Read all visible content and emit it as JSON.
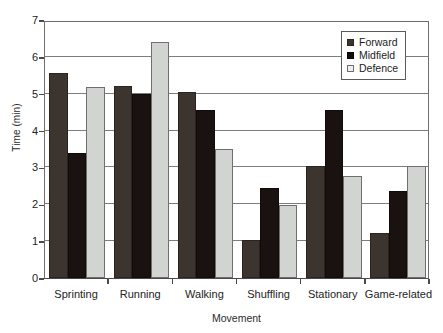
{
  "chart_data": {
    "type": "bar",
    "title": "",
    "xlabel": "Movement",
    "ylabel": "Time (min)",
    "categories": [
      "Sprinting",
      "Running",
      "Walking",
      "Shuffling",
      "Stationary",
      "Game-related"
    ],
    "series": [
      {
        "name": "Forward",
        "color": "#3c352f",
        "values": [
          5.55,
          5.2,
          5.05,
          1.03,
          3.05,
          1.22
        ]
      },
      {
        "name": "Midfield",
        "color": "#1a1210",
        "values": [
          3.38,
          5.0,
          4.55,
          2.45,
          4.57,
          2.37
        ]
      },
      {
        "name": "Defence",
        "color": "#d2d4d2",
        "values": [
          5.18,
          6.4,
          3.5,
          1.97,
          2.78,
          3.05
        ]
      }
    ],
    "ylim": [
      0,
      7
    ],
    "ytick_labels": [
      "0",
      "1",
      "2",
      "3",
      "4",
      "5",
      "6",
      "7"
    ],
    "ytick_values": [
      0,
      1,
      2,
      3,
      4,
      5,
      6,
      7
    ],
    "grid": "horizontal",
    "legend_position": "top-right",
    "legend_entries": [
      "Forward",
      "Midfield",
      "Defence"
    ]
  }
}
